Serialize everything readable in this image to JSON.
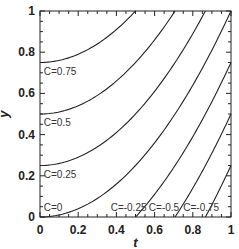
{
  "chart_data": {
    "type": "line",
    "title": "",
    "xlabel": "t",
    "ylabel": "y",
    "xlim": [
      0,
      1
    ],
    "ylim": [
      0,
      1
    ],
    "xticks": [
      "0",
      "0.2",
      "0.4",
      "0.6",
      "0.8",
      "1"
    ],
    "yticks": [
      "0",
      "0.2",
      "0.4",
      "0.6",
      "0.8",
      "1"
    ],
    "grid": false,
    "legend": "none",
    "series": [
      {
        "name": "C=0.75",
        "C": 0.75,
        "label_pos": [
          0.02,
          0.69
        ]
      },
      {
        "name": "C=0.5",
        "C": 0.5,
        "label_pos": [
          0.02,
          0.44
        ]
      },
      {
        "name": "C=0.25",
        "C": 0.25,
        "label_pos": [
          0.02,
          0.19
        ]
      },
      {
        "name": "C=0",
        "C": 0,
        "label_pos": [
          0.02,
          0.03
        ]
      },
      {
        "name": "C=-0.25",
        "C": -0.25,
        "label_pos": [
          0.37,
          0.03
        ]
      },
      {
        "name": "C=-0.5",
        "C": -0.5,
        "label_pos": [
          0.57,
          0.03
        ]
      },
      {
        "name": "C=-0.75",
        "C": -0.75,
        "label_pos": [
          0.75,
          0.03
        ]
      }
    ]
  }
}
